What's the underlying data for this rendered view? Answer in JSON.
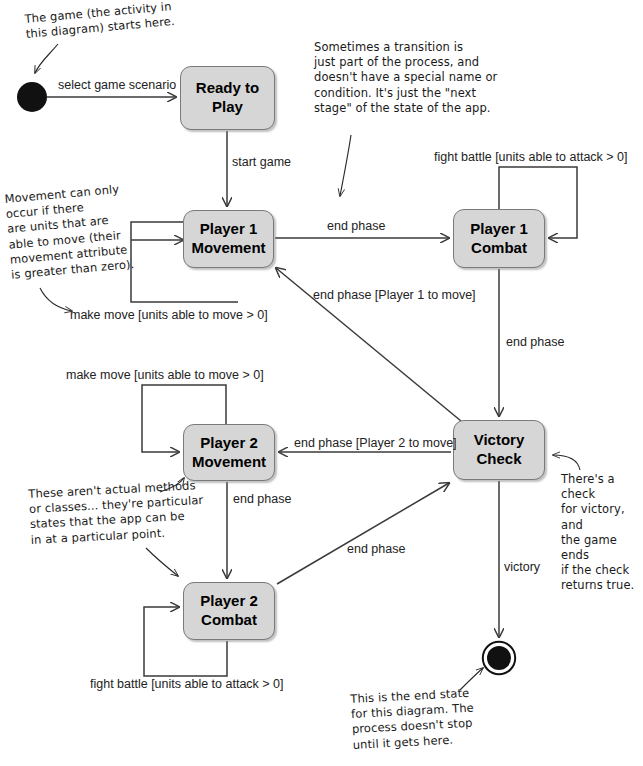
{
  "diagram": {
    "colors": {
      "state_fill": "#d6d6d6",
      "state_border": "#7a7a7a",
      "line": "#3a3a3a",
      "note_text": "#1a1a1a",
      "label_text": "#222222",
      "node_fill": "#111111"
    },
    "nodes": [
      {
        "id": "start",
        "type": "initial-node",
        "cx": 32,
        "cy": 97,
        "r": 15
      },
      {
        "id": "ready",
        "type": "state",
        "line1": "Ready to",
        "line2": "Play",
        "x": 180,
        "y": 66,
        "w": 95,
        "h": 64
      },
      {
        "id": "p1move",
        "type": "state",
        "line1": "Player 1",
        "line2": "Movement",
        "x": 183,
        "y": 210,
        "w": 91,
        "h": 58
      },
      {
        "id": "p1combat",
        "type": "state",
        "line1": "Player 1",
        "line2": "Combat",
        "x": 453,
        "y": 209,
        "w": 92,
        "h": 59
      },
      {
        "id": "victory",
        "type": "state",
        "line1": "Victory",
        "line2": "Check",
        "x": 453,
        "y": 420,
        "w": 92,
        "h": 60
      },
      {
        "id": "p2move",
        "type": "state",
        "line1": "Player 2",
        "line2": "Movement",
        "x": 183,
        "y": 424,
        "w": 92,
        "h": 57
      },
      {
        "id": "p2combat",
        "type": "state",
        "line1": "Player 2",
        "line2": "Combat",
        "x": 183,
        "y": 582,
        "w": 92,
        "h": 58
      },
      {
        "id": "end",
        "type": "final-node",
        "cx": 499,
        "cy": 658,
        "r_outer": 17,
        "r_inner": 12
      }
    ],
    "transitions": [
      {
        "id": "t-select",
        "label": "select game scenario",
        "from": "start",
        "to": "ready"
      },
      {
        "id": "t-startgame",
        "label": "start game",
        "from": "ready",
        "to": "p1move"
      },
      {
        "id": "t-p1move-self",
        "label": "make move [units able to move > 0]",
        "from": "p1move",
        "to": "p1move"
      },
      {
        "id": "t-p1move-combat",
        "label": "end phase",
        "from": "p1move",
        "to": "p1combat"
      },
      {
        "id": "t-p1combat-self",
        "label": "fight battle [units able to attack > 0]",
        "from": "p1combat",
        "to": "p1combat"
      },
      {
        "id": "t-p1combat-victory",
        "label": "end phase",
        "from": "p1combat",
        "to": "victory"
      },
      {
        "id": "t-victory-p1move",
        "label": "end phase [Player 1 to move]",
        "from": "victory",
        "to": "p1move"
      },
      {
        "id": "t-victory-p2move",
        "label": "end phase [Player 2 to move]",
        "from": "victory",
        "to": "p2move"
      },
      {
        "id": "t-p2move-self",
        "label": "make move [units able to move > 0]",
        "from": "p2move",
        "to": "p2move"
      },
      {
        "id": "t-p2move-combat",
        "label": "end phase",
        "from": "p2move",
        "to": "p2combat"
      },
      {
        "id": "t-p2combat-self",
        "label": "fight battle [units able to attack > 0]",
        "from": "p2combat",
        "to": "p2combat"
      },
      {
        "id": "t-p2combat-victory",
        "label": "end phase",
        "from": "p2combat",
        "to": "victory"
      },
      {
        "id": "t-victory-end",
        "label": "victory",
        "from": "victory",
        "to": "end"
      }
    ],
    "notes": [
      {
        "id": "note-start",
        "text": "The game (the activity in\nthis diagram) starts here.",
        "x": 24,
        "y": 12,
        "rotate": -5
      },
      {
        "id": "note-transition",
        "text": "Sometimes a transition is\njust part of the process, and\ndoesn't have a special name or\ncondition. It's just the \"next\nstage\" of the state of the app.",
        "x": 314,
        "y": 40,
        "rotate": 0
      },
      {
        "id": "note-movement",
        "text": "Movement can only\noccur if there\nare units that are\nable to move (their\nmovement attribute\nis greater than zero).",
        "x": 4,
        "y": 192,
        "rotate": -5
      },
      {
        "id": "note-states",
        "text": "These aren't actual methods\nor classes... they're particular\nstates that the app can be\nin at a particular point.",
        "x": 28,
        "y": 487,
        "rotate": -3
      },
      {
        "id": "note-victory",
        "text": "There's a check\nfor victory, and\nthe game ends\nif the check\nreturns true.",
        "x": 561,
        "y": 472,
        "rotate": 0
      },
      {
        "id": "note-end",
        "text": "This is the end state\nfor this diagram. The\nprocess doesn't stop\nuntil it gets here.",
        "x": 350,
        "y": 692,
        "rotate": -3
      }
    ]
  }
}
